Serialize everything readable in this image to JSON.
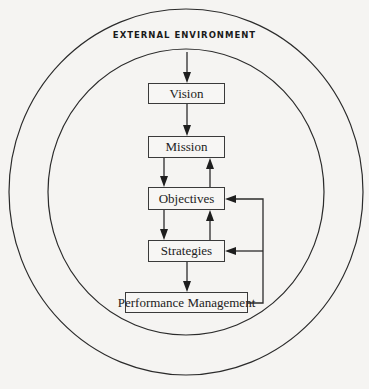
{
  "diagram": {
    "title": "EXTERNAL ENVIRONMENT",
    "nodes": [
      {
        "id": "vision",
        "label": "Vision"
      },
      {
        "id": "mission",
        "label": "Mission"
      },
      {
        "id": "objectives",
        "label": "Objectives"
      },
      {
        "id": "strategies",
        "label": "Strategies"
      },
      {
        "id": "performance",
        "label": "Performance Management"
      }
    ],
    "edges": [
      {
        "from": "external-environment",
        "to": "vision"
      },
      {
        "from": "vision",
        "to": "mission"
      },
      {
        "from": "mission",
        "to": "objectives"
      },
      {
        "from": "objectives",
        "to": "mission"
      },
      {
        "from": "objectives",
        "to": "strategies"
      },
      {
        "from": "strategies",
        "to": "objectives"
      },
      {
        "from": "strategies",
        "to": "performance"
      },
      {
        "from": "performance",
        "to": "objectives"
      },
      {
        "from": "performance",
        "to": "strategies"
      }
    ],
    "rings": [
      "external-environment",
      "organization"
    ]
  }
}
